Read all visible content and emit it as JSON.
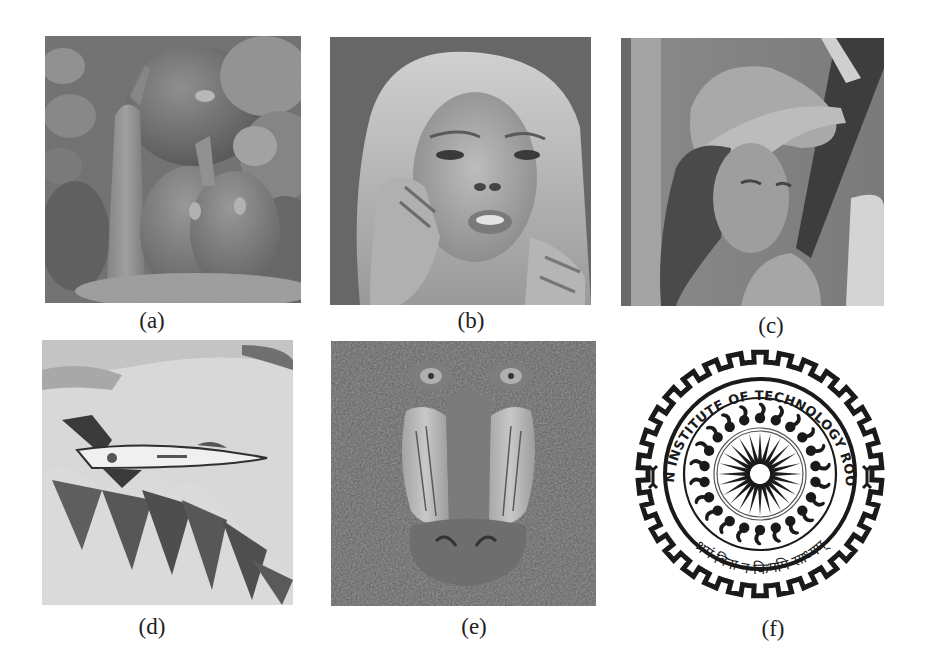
{
  "figure": {
    "panels": [
      {
        "id": "a",
        "caption": "(a)",
        "subject": "Peppers",
        "kind": "grayscale-photo"
      },
      {
        "id": "b",
        "caption": "(b)",
        "subject": "Woman portrait with hands near face",
        "kind": "grayscale-photo"
      },
      {
        "id": "c",
        "caption": "(c)",
        "subject": "Lena",
        "kind": "grayscale-photo"
      },
      {
        "id": "d",
        "caption": "(d)",
        "subject": "F-16 jet over mountains",
        "kind": "grayscale-photo"
      },
      {
        "id": "e",
        "caption": "(e)",
        "subject": "Baboon (mandrill)",
        "kind": "grayscale-photo"
      },
      {
        "id": "f",
        "caption": "(f)",
        "subject": "IIT Roorkee logo",
        "kind": "binary-logo"
      }
    ],
    "logo": {
      "arc_text": "INDIAN INSTITUTE OF TECHNOLOGY ROORKEE",
      "motto": "श्रमं विना न किमपि साध्यम्",
      "spokes": 24,
      "colors": {
        "ink": "#1a1a1a",
        "paper": "#ffffff"
      }
    },
    "colors": {
      "background": "#ffffff",
      "caption": "#1e1e1e"
    }
  }
}
